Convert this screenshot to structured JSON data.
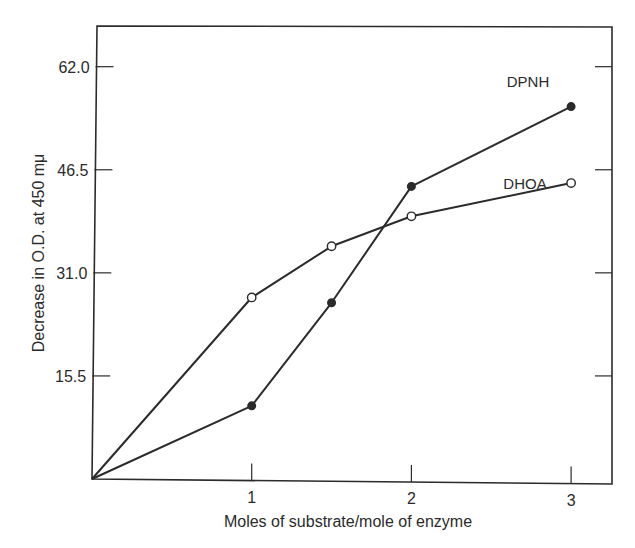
{
  "chart_data": {
    "type": "line",
    "title": "",
    "xlabel": "Moles of substrate/mole of enzyme",
    "ylabel": "Decrease in O.D. at 450 mμ",
    "xlim": [
      0,
      3.25
    ],
    "ylim": [
      0,
      68
    ],
    "x_ticks": [
      1,
      2,
      3
    ],
    "x_tick_labels": [
      "1",
      "2",
      "3"
    ],
    "y_ticks": [
      15.5,
      31.0,
      46.5,
      62.0
    ],
    "y_tick_labels": [
      "15.5",
      "31.0",
      "46.5",
      "62.0"
    ],
    "grid": false,
    "legend": "inline labels at line ends",
    "series": [
      {
        "name": "DPNH",
        "marker": "filled-circle",
        "x": [
          0,
          1,
          1.5,
          2,
          3
        ],
        "y": [
          0,
          11.0,
          26.5,
          44.0,
          56.0
        ]
      },
      {
        "name": "DHOA",
        "marker": "open-circle",
        "x": [
          0,
          1,
          1.5,
          2,
          3
        ],
        "y": [
          0,
          27.3,
          35.0,
          39.5,
          44.5
        ]
      }
    ]
  },
  "colors": {
    "line": "#2b2b2b",
    "background": "#ffffff",
    "marker_fill_open": "#ffffff",
    "marker_fill_filled": "#2b2b2b"
  }
}
